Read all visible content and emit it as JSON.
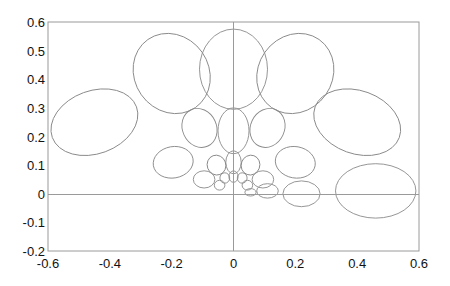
{
  "chart_data": {
    "type": "scatter",
    "title": "",
    "xlabel": "",
    "ylabel": "",
    "xlim": [
      -0.6,
      0.6
    ],
    "ylim": [
      -0.2,
      0.6
    ],
    "xticks": [
      "-0.6",
      "-0.4",
      "-0.2",
      "0",
      "0.2",
      "0.4",
      "0.6"
    ],
    "yticks": [
      "-0.2",
      "-0.1",
      "0",
      "0.1",
      "0.2",
      "0.3",
      "0.4",
      "0.5",
      "0.6"
    ],
    "grid": false,
    "legend": null,
    "zero_lines": true,
    "ellipses": [
      {
        "ring": 4,
        "cx": -0.45,
        "cy": 0.25,
        "rx": 0.145,
        "ry": 0.11,
        "angle": -20
      },
      {
        "ring": 4,
        "cx": -0.2,
        "cy": 0.42,
        "rx": 0.12,
        "ry": 0.145,
        "angle": -35
      },
      {
        "ring": 4,
        "cx": 0.0,
        "cy": 0.435,
        "rx": 0.11,
        "ry": 0.14,
        "angle": 0
      },
      {
        "ring": 4,
        "cx": 0.2,
        "cy": 0.42,
        "rx": 0.12,
        "ry": 0.145,
        "angle": 35
      },
      {
        "ring": 4,
        "cx": 0.4,
        "cy": 0.25,
        "rx": 0.145,
        "ry": 0.11,
        "angle": 20
      },
      {
        "ring": 4,
        "cx": 0.46,
        "cy": 0.01,
        "rx": 0.13,
        "ry": 0.095,
        "angle": 0
      },
      {
        "ring": 3,
        "cx": -0.195,
        "cy": 0.11,
        "rx": 0.065,
        "ry": 0.055,
        "angle": -10
      },
      {
        "ring": 3,
        "cx": -0.11,
        "cy": 0.23,
        "rx": 0.055,
        "ry": 0.07,
        "angle": -25
      },
      {
        "ring": 3,
        "cx": 0.0,
        "cy": 0.22,
        "rx": 0.05,
        "ry": 0.08,
        "angle": 0
      },
      {
        "ring": 3,
        "cx": 0.11,
        "cy": 0.23,
        "rx": 0.055,
        "ry": 0.07,
        "angle": 25
      },
      {
        "ring": 3,
        "cx": 0.2,
        "cy": 0.11,
        "rx": 0.065,
        "ry": 0.055,
        "angle": 10
      },
      {
        "ring": 3,
        "cx": 0.22,
        "cy": 0.0,
        "rx": 0.06,
        "ry": 0.045,
        "angle": 0
      },
      {
        "ring": 2,
        "cx": -0.095,
        "cy": 0.05,
        "rx": 0.035,
        "ry": 0.03,
        "angle": 0
      },
      {
        "ring": 2,
        "cx": -0.055,
        "cy": 0.1,
        "rx": 0.03,
        "ry": 0.035,
        "angle": -20
      },
      {
        "ring": 2,
        "cx": 0.0,
        "cy": 0.11,
        "rx": 0.025,
        "ry": 0.04,
        "angle": 0
      },
      {
        "ring": 2,
        "cx": 0.055,
        "cy": 0.1,
        "rx": 0.03,
        "ry": 0.035,
        "angle": 20
      },
      {
        "ring": 2,
        "cx": 0.095,
        "cy": 0.05,
        "rx": 0.035,
        "ry": 0.03,
        "angle": 0
      },
      {
        "ring": 2,
        "cx": 0.11,
        "cy": 0.01,
        "rx": 0.035,
        "ry": 0.025,
        "angle": 0
      },
      {
        "ring": 1,
        "cx": -0.045,
        "cy": 0.03,
        "rx": 0.017,
        "ry": 0.017,
        "angle": 0
      },
      {
        "ring": 1,
        "cx": -0.028,
        "cy": 0.055,
        "rx": 0.016,
        "ry": 0.018,
        "angle": 0
      },
      {
        "ring": 1,
        "cx": 0.0,
        "cy": 0.06,
        "rx": 0.015,
        "ry": 0.02,
        "angle": 0
      },
      {
        "ring": 1,
        "cx": 0.028,
        "cy": 0.055,
        "rx": 0.016,
        "ry": 0.018,
        "angle": 0
      },
      {
        "ring": 1,
        "cx": 0.045,
        "cy": 0.03,
        "rx": 0.017,
        "ry": 0.017,
        "angle": 0
      },
      {
        "ring": 1,
        "cx": 0.055,
        "cy": 0.005,
        "rx": 0.018,
        "ry": 0.013,
        "angle": 0
      }
    ]
  },
  "colors": {
    "background": "#ffffff",
    "frame": "#9a9a9a",
    "ellipse_stroke": "#8a8a8a",
    "tick_text": "#111111"
  }
}
